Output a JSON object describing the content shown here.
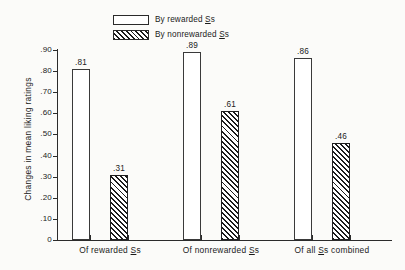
{
  "chart_data": {
    "type": "bar",
    "title": "",
    "xlabel": "",
    "ylabel": "Changes in mean liking ratings",
    "ylim": [
      0,
      0.9
    ],
    "grid": false,
    "legend_position": "top-center",
    "ytick_labels": [
      ".90",
      ".80",
      ".70",
      ".60",
      ".50",
      ".40",
      ".30",
      ".20",
      ".10",
      "0"
    ],
    "ytick_values": [
      0.9,
      0.8,
      0.7,
      0.6,
      0.5,
      0.4,
      0.3,
      0.2,
      0.1,
      0.0
    ],
    "categories": [
      "Of rewarded Ss",
      "Of nonrewarded Ss",
      "Of all Ss combined"
    ],
    "series": [
      {
        "name": "By rewarded Ss",
        "style": "open",
        "values": [
          0.81,
          0.89,
          0.86
        ],
        "labels": [
          ".81",
          ".89",
          ".86"
        ]
      },
      {
        "name": "By nonrewarded Ss",
        "style": "hatched",
        "values": [
          0.31,
          0.61,
          0.46
        ],
        "labels": [
          ".31",
          ".61",
          ".46"
        ]
      }
    ]
  },
  "legend": {
    "items": [
      {
        "label_prefix": "By rewarded ",
        "label_underlined": "S",
        "label_suffix": "s",
        "style": "open"
      },
      {
        "label_prefix": "By nonrewarded ",
        "label_underlined": "S",
        "label_suffix": "s",
        "style": "hatched"
      }
    ]
  },
  "axes": {
    "y_title": "Changes in mean liking ratings",
    "groups": [
      {
        "prefix": "Of rewarded ",
        "underlined": "S",
        "suffix": "s"
      },
      {
        "prefix": "Of nonrewarded ",
        "underlined": "S",
        "suffix": "s"
      },
      {
        "prefix": "Of all ",
        "underlined": "S",
        "suffix": "s combined"
      }
    ]
  },
  "colors": {
    "ink": "#2b2b2b",
    "paper": "#fbfbf9",
    "hatch": "#1c1c1c"
  }
}
